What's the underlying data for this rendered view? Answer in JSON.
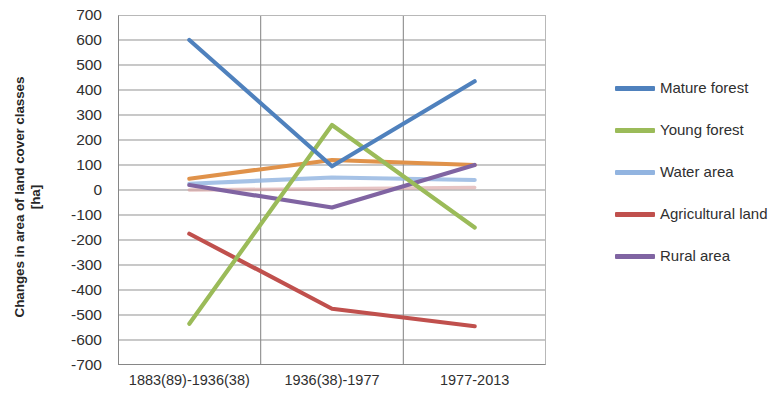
{
  "chart_data": {
    "type": "line",
    "title": "",
    "xlabel": "",
    "ylabel": "Changes in area of land cover classes [ha]",
    "ylabel_lines": [
      "Changes in area of land cover classes",
      "[ha]"
    ],
    "categories": [
      "1883(89)-1936(38)",
      "1936(38)-1977",
      "1977-2013"
    ],
    "ylim": [
      -700,
      700
    ],
    "ytick_labels": [
      "700",
      "600",
      "500",
      "400",
      "300",
      "200",
      "100",
      "0",
      "-100",
      "-200",
      "-300",
      "-400",
      "-500",
      "-600",
      "-700"
    ],
    "ytick_values": [
      700,
      600,
      500,
      400,
      300,
      200,
      100,
      0,
      -100,
      -200,
      -300,
      -400,
      -500,
      -600,
      -700
    ],
    "grid": "horizontal",
    "legend_position": "right",
    "series": [
      {
        "name": "Mature forest",
        "color": "#4F81BD",
        "values": [
          600,
          95,
          435
        ],
        "in_legend": true
      },
      {
        "name": "Young forest",
        "color": "#9BBB59",
        "values": [
          -535,
          260,
          -150
        ],
        "in_legend": true
      },
      {
        "name": "Water area",
        "color": "#92B4E0",
        "values": [
          25,
          50,
          40
        ],
        "in_legend": true
      },
      {
        "name": "Agricultural land",
        "color": "#C0504D",
        "values": [
          -175,
          -475,
          -545
        ],
        "in_legend": true
      },
      {
        "name": "Rural area",
        "color": "#8064A2",
        "values": [
          20,
          -70,
          100
        ],
        "in_legend": true
      },
      {
        "name": "series-6",
        "color": "#E0924A",
        "values": [
          45,
          120,
          100
        ],
        "in_legend": false
      },
      {
        "name": "series-7",
        "color": "#D8A0A0",
        "values": [
          0,
          5,
          10
        ],
        "in_legend": false
      }
    ]
  },
  "legend": {
    "entries": [
      {
        "label": "Mature forest",
        "color": "#4F81BD"
      },
      {
        "label": "Young forest",
        "color": "#9BBB59"
      },
      {
        "label": "Water area",
        "color": "#92B4E0"
      },
      {
        "label": "Agricultural land",
        "color": "#C0504D"
      },
      {
        "label": "Rural area",
        "color": "#8064A2"
      }
    ]
  }
}
